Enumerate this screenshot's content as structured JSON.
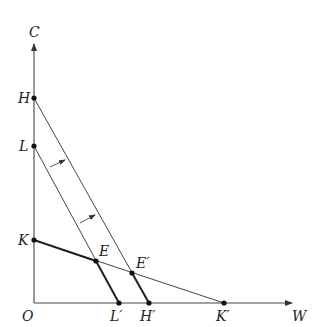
{
  "diagram": {
    "type": "budget-constraint",
    "axes": {
      "y_label": "C",
      "x_label": "W",
      "origin_label": "O"
    },
    "points": {
      "H": {
        "label": "H",
        "x": 34,
        "y": 98
      },
      "L": {
        "label": "L",
        "x": 34,
        "y": 146
      },
      "K": {
        "label": "K",
        "x": 34,
        "y": 240
      },
      "E": {
        "label": "E",
        "x": 96,
        "y": 261
      },
      "E_prime": {
        "label": "E′",
        "x": 132,
        "y": 273
      },
      "L_prime": {
        "label": "L′",
        "x": 119,
        "y": 302
      },
      "H_prime": {
        "label": "H′",
        "x": 149,
        "y": 302
      },
      "K_prime": {
        "label": "K′",
        "x": 224,
        "y": 302
      }
    },
    "lines": [
      {
        "from": "H",
        "to": "H_prime",
        "style": "thin",
        "note": "outer budget line"
      },
      {
        "from": "L",
        "to": "L_prime",
        "style": "thin",
        "note": "inner budget line"
      },
      {
        "from": "K",
        "to": "K_prime",
        "style": "thin",
        "note": "flatter line"
      },
      {
        "from": "K",
        "to": "E",
        "style": "thick"
      },
      {
        "from": "E",
        "to": "L_prime",
        "style": "thick"
      },
      {
        "from": "E_prime",
        "to": "H_prime",
        "style": "thick"
      }
    ],
    "shift_arrows": [
      {
        "from": [
          50,
          167
        ],
        "to": [
          65,
          160
        ]
      },
      {
        "from": [
          80,
          223
        ],
        "to": [
          95,
          215
        ]
      }
    ]
  }
}
